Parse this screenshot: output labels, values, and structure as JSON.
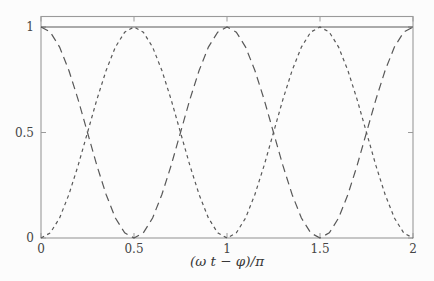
{
  "figure": {
    "background": "#fcfcfc",
    "frame_color": "#9a9a9a",
    "curve_color": "#585858",
    "text_color": "#454545"
  },
  "chart_data": {
    "type": "line",
    "title": "",
    "xlabel": "(ω t − φ)/π",
    "ylabel": "",
    "xlim": [
      0,
      2
    ],
    "ylim": [
      0,
      1.05
    ],
    "xticks": [
      0,
      0.5,
      1,
      1.5,
      2
    ],
    "yticks": [
      0,
      0.5,
      1
    ],
    "grid": false,
    "legend": "none",
    "x": [
      0,
      0.05,
      0.1,
      0.15,
      0.2,
      0.25,
      0.3,
      0.35,
      0.4,
      0.45,
      0.5,
      0.55,
      0.6,
      0.65,
      0.7,
      0.75,
      0.8,
      0.85,
      0.9,
      0.95,
      1,
      1.05,
      1.1,
      1.15,
      1.2,
      1.25,
      1.3,
      1.35,
      1.4,
      1.45,
      1.5,
      1.55,
      1.6,
      1.65,
      1.7,
      1.75,
      1.8,
      1.85,
      1.9,
      1.95,
      2
    ],
    "series": [
      {
        "name": "constant-sum-1",
        "style": "solid",
        "values": [
          1,
          1,
          1,
          1,
          1,
          1,
          1,
          1,
          1,
          1,
          1,
          1,
          1,
          1,
          1,
          1,
          1,
          1,
          1,
          1,
          1,
          1,
          1,
          1,
          1,
          1,
          1,
          1,
          1,
          1,
          1,
          1,
          1,
          1,
          1,
          1,
          1,
          1,
          1,
          1,
          1
        ]
      },
      {
        "name": "cos-squared",
        "style": "long-dash",
        "values": [
          1,
          0.976,
          0.905,
          0.794,
          0.655,
          0.5,
          0.345,
          0.206,
          0.095,
          0.024,
          0,
          0.024,
          0.095,
          0.206,
          0.345,
          0.5,
          0.655,
          0.794,
          0.905,
          0.976,
          1,
          0.976,
          0.905,
          0.794,
          0.655,
          0.5,
          0.345,
          0.206,
          0.095,
          0.024,
          0,
          0.024,
          0.095,
          0.206,
          0.345,
          0.5,
          0.655,
          0.794,
          0.905,
          0.976,
          1
        ]
      },
      {
        "name": "sin-squared",
        "style": "short-dash",
        "values": [
          0,
          0.024,
          0.095,
          0.206,
          0.345,
          0.5,
          0.655,
          0.794,
          0.905,
          0.976,
          1,
          0.976,
          0.905,
          0.794,
          0.655,
          0.5,
          0.345,
          0.206,
          0.095,
          0.024,
          0,
          0.024,
          0.095,
          0.206,
          0.345,
          0.5,
          0.655,
          0.794,
          0.905,
          0.976,
          1,
          0.976,
          0.905,
          0.794,
          0.655,
          0.5,
          0.345,
          0.206,
          0.095,
          0.024,
          0
        ]
      }
    ]
  }
}
